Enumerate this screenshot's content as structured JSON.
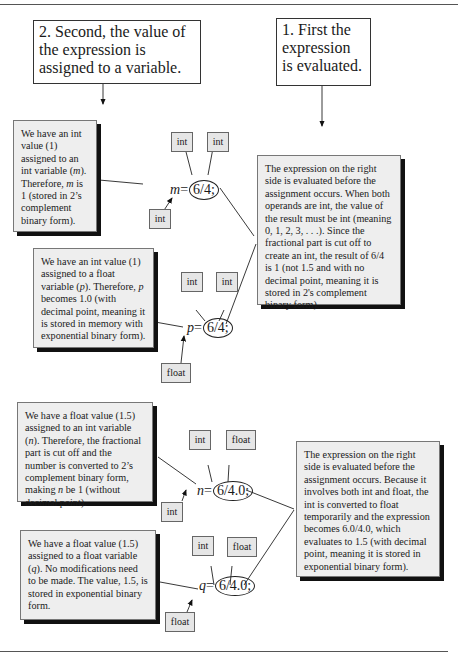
{
  "step_boxes": {
    "step2": "2. Second, the value of the expression is assigned to a variable.",
    "step1": "1. First the expression is evaluated."
  },
  "examples": [
    {
      "id": "m",
      "variable": "m",
      "expression": "6/4;",
      "operand_types": [
        "int",
        "int"
      ],
      "variable_type": "int",
      "assign_note": "We have an int value (1) assigned to an int variable (m). Therefore, m is 1 (stored in 2's complement binary form)."
    },
    {
      "id": "p",
      "variable": "p",
      "expression": "6/4;",
      "operand_types": [
        "int",
        "int"
      ],
      "variable_type": "float",
      "assign_note": "We have an int value (1) assigned to a float variable (p). Therefore, p becomes 1.0 (with decimal point, meaning it is stored in memory with exponential binary form)."
    },
    {
      "id": "n",
      "variable": "n",
      "expression": "6/4.0;",
      "operand_types": [
        "int",
        "float"
      ],
      "variable_type": "int",
      "assign_note": "We have a float value (1.5) assigned to an int variable (n). Therefore, the fractional part is cut off and the number is converted to 2's complement binary form, making n be 1 (without decimal point)."
    },
    {
      "id": "q",
      "variable": "q",
      "expression": "6/4.0;",
      "operand_types": [
        "int",
        "float"
      ],
      "variable_type": "float",
      "assign_note": "We have a float value (1.5) assigned to a float variable (q). No modifications need to be made. The value, 1.5, is stored in exponential binary form."
    }
  ],
  "eval_notes": {
    "int_int": "The expression on the right side is evaluated before the assignment occurs. When both operands are int, the value of the result must be int (meaning 0, 1, 2, 3, . . .). Since the fractional part is cut off to create an int, the result of 6/4 is 1 (not 1.5 and with no decimal point, meaning it is stored in 2's complement binary form).",
    "int_float": "The expression on the right side is evaluated before the assignment occurs. Because it involves both int and float, the int is converted to float temporarily and the expression becomes 6.0/4.0, which evaluates to 1.5 (with decimal point, meaning it is stored in exponential binary form)."
  },
  "eq": "="
}
